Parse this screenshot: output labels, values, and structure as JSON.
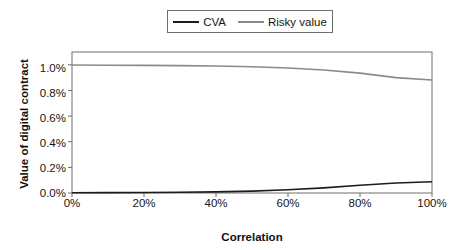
{
  "chart_data": {
    "type": "line",
    "title": "",
    "xlabel": "Correlation",
    "ylabel": "Value of digital contract",
    "xlim": [
      0,
      100
    ],
    "ylim": [
      0,
      1.1
    ],
    "grid": false,
    "legend_position": "top-center",
    "x_tick_labels": [
      "0%",
      "20%",
      "40%",
      "60%",
      "80%",
      "100%"
    ],
    "x_tick_values": [
      0,
      20,
      40,
      60,
      80,
      100
    ],
    "y_tick_labels": [
      "0.0%",
      "0.2%",
      "0.4%",
      "0.6%",
      "0.8%",
      "1.0%"
    ],
    "y_tick_values": [
      0.0,
      0.2,
      0.4,
      0.6,
      0.8,
      1.0
    ],
    "x": [
      0,
      10,
      20,
      30,
      40,
      50,
      60,
      70,
      80,
      90,
      100
    ],
    "series": [
      {
        "name": "CVA",
        "color": "#1c1c1c",
        "values": [
          0.002,
          0.003,
          0.004,
          0.006,
          0.009,
          0.015,
          0.025,
          0.04,
          0.06,
          0.078,
          0.088
        ]
      },
      {
        "name": "Risky value",
        "color": "#8a8a8a",
        "values": [
          0.998,
          0.997,
          0.996,
          0.994,
          0.991,
          0.985,
          0.975,
          0.96,
          0.935,
          0.9,
          0.881
        ]
      }
    ]
  },
  "legend": {
    "entries": [
      {
        "label": "CVA",
        "color": "#1c1c1c"
      },
      {
        "label": "Risky value",
        "color": "#8a8a8a"
      }
    ]
  },
  "axes": {
    "y_title": "Value of digital contract",
    "x_title": "Correlation",
    "y_labels": [
      "1.0%",
      "0.8%",
      "0.6%",
      "0.4%",
      "0.2%",
      "0.0%"
    ],
    "x_labels": [
      "0%",
      "20%",
      "40%",
      "60%",
      "80%",
      "100%"
    ]
  },
  "colors": {
    "cva_line": "#1c1c1c",
    "risky_line": "#8a8a8a",
    "axis": "#6e6e6e",
    "text": "#161616",
    "background": "#ffffff"
  }
}
